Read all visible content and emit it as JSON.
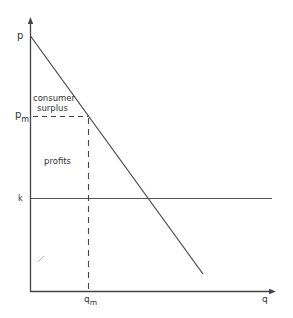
{
  "diagram": {
    "type": "monopoly pricing diagram",
    "axes": {
      "y_label": "p",
      "x_label": "q"
    },
    "labels": {
      "p_intercept": "p",
      "pm": "p",
      "pm_sub": "m",
      "qm": "q",
      "qm_sub": "m",
      "k": "k",
      "consumer_surplus_line1": "consumer",
      "consumer_surplus_line2": "surplus",
      "profits": "profits"
    },
    "elements": [
      {
        "name": "demand-line",
        "from": [
          30,
          36
        ],
        "to": [
          203,
          274
        ]
      },
      {
        "name": "cost-line-k",
        "from": [
          31,
          198
        ],
        "to": [
          272,
          198
        ]
      },
      {
        "name": "pm-dashed-line",
        "from": [
          31,
          116
        ],
        "to": [
          88,
          116
        ]
      },
      {
        "name": "qm-dashed-line",
        "from": [
          88,
          116
        ],
        "to": [
          88,
          291
        ]
      }
    ],
    "colors": {
      "line": "#444444",
      "text": "#333333"
    }
  }
}
